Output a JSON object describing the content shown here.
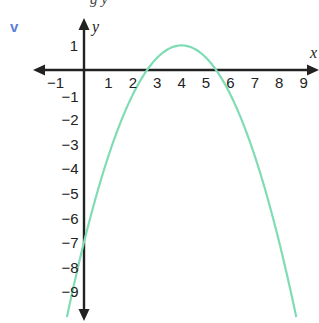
{
  "caption_fragment": "g y",
  "part_label": "v",
  "colors": {
    "part_label": "#5b7fd6",
    "curve": "#7fdcb4",
    "axes": "#222222"
  },
  "chart_data": {
    "type": "line",
    "title": "",
    "xlabel": "x",
    "ylabel": "y",
    "xlim": [
      -1,
      9
    ],
    "ylim": [
      -9,
      1
    ],
    "grid": false,
    "legend": null,
    "x_ticks": [
      -1,
      1,
      2,
      3,
      4,
      5,
      6,
      7,
      8,
      9
    ],
    "y_ticks": [
      1,
      -1,
      -2,
      -3,
      -4,
      -5,
      -6,
      -7,
      -8,
      -9
    ],
    "series": [
      {
        "name": "parabola",
        "equation": "y = -0.5(x - 4)^2 + 1",
        "vertex": [
          4,
          1
        ],
        "y_intercept": -7,
        "x_intercepts": [
          2.59,
          5.41
        ],
        "x": [
          -0.7,
          0,
          1,
          2,
          2.59,
          3,
          4,
          5,
          5.41,
          6,
          7,
          8,
          8.7
        ],
        "y": [
          -10.05,
          -7,
          -3.5,
          -1,
          0,
          0.5,
          1,
          0.5,
          0,
          -1,
          -3.5,
          -7,
          -10.05
        ]
      }
    ]
  }
}
